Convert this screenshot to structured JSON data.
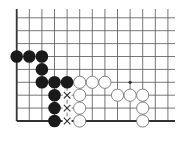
{
  "diagram": {
    "type": "go-board-fragment",
    "board_section": "lower-left corner",
    "colors": {
      "background": "#ffffff",
      "grid": "#555555",
      "edge": "#333333",
      "black_stone": "#1a1a1a",
      "white_stone_fill": "#ffffff",
      "white_stone_stroke": "#777777",
      "mark": "#333333"
    },
    "grid": {
      "origin_x": 16.7,
      "col_spacing": 12.6,
      "columns": 13,
      "bottom_y": 121,
      "row_spacing": 12.9,
      "rows": 9,
      "top_y": 9,
      "right_x": 175,
      "edges": [
        "left",
        "bottom"
      ]
    },
    "hoshi": [
      {
        "col": 9,
        "row": 3
      }
    ],
    "stones": {
      "black": [
        {
          "col": 0,
          "row": 5
        },
        {
          "col": 1,
          "row": 5
        },
        {
          "col": 2,
          "row": 5
        },
        {
          "col": 2,
          "row": 4
        },
        {
          "col": 2,
          "row": 3
        },
        {
          "col": 3,
          "row": 3
        },
        {
          "col": 4,
          "row": 3
        },
        {
          "col": 3,
          "row": 2
        },
        {
          "col": 3,
          "row": 1
        },
        {
          "col": 3,
          "row": 0
        }
      ],
      "white": [
        {
          "col": 5,
          "row": 3
        },
        {
          "col": 6,
          "row": 3
        },
        {
          "col": 7,
          "row": 3
        },
        {
          "col": 5,
          "row": 2
        },
        {
          "col": 5,
          "row": 1
        },
        {
          "col": 5,
          "row": 0
        },
        {
          "col": 8,
          "row": 2
        },
        {
          "col": 9,
          "row": 2
        },
        {
          "col": 10,
          "row": 2
        },
        {
          "col": 10,
          "row": 1
        },
        {
          "col": 10,
          "row": 0
        }
      ]
    },
    "marks": [
      {
        "type": "x",
        "col": 4,
        "row": 2
      },
      {
        "type": "x",
        "col": 4,
        "row": 1
      },
      {
        "type": "x",
        "col": 4,
        "row": 0
      }
    ]
  }
}
